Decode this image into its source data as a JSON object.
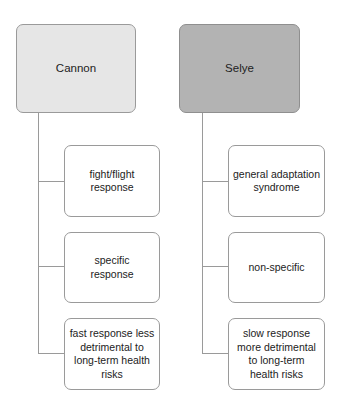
{
  "diagram": {
    "type": "tree",
    "columns": [
      {
        "root": {
          "label": "Cannon",
          "fill": "#e6e6e6"
        },
        "children": [
          {
            "label": "fight/flight response"
          },
          {
            "label": "specific response"
          },
          {
            "label": "fast response less detrimental to long-term health risks"
          }
        ]
      },
      {
        "root": {
          "label": "Selye",
          "fill": "#b3b3b3"
        },
        "children": [
          {
            "label": "general adaptation syndrome"
          },
          {
            "label": "non-specific"
          },
          {
            "label": "slow response more detrimental to long-term health risks"
          }
        ]
      }
    ],
    "colors": {
      "border": "#9a9a9a",
      "line": "#9a9a9a",
      "child_fill": "#ffffff",
      "text": "#222222"
    }
  }
}
